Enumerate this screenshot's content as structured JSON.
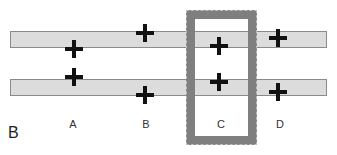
{
  "panel_label": "B",
  "columns": [
    {
      "label": "A",
      "x": 73
    },
    {
      "label": "B",
      "x": 146
    },
    {
      "label": "C",
      "x": 221
    },
    {
      "label": "D",
      "x": 280
    }
  ],
  "bars": [
    {
      "name": "top-bar",
      "top": 31
    },
    {
      "name": "bottom-bar",
      "top": 79
    }
  ],
  "markers": [
    {
      "column": "A",
      "bar": "top",
      "x": 74,
      "y": 49
    },
    {
      "column": "A",
      "bar": "bottom",
      "x": 74,
      "y": 77
    },
    {
      "column": "B",
      "bar": "top",
      "x": 145,
      "y": 33
    },
    {
      "column": "B",
      "bar": "bottom",
      "x": 145,
      "y": 95
    },
    {
      "column": "C",
      "bar": "top",
      "x": 219,
      "y": 46
    },
    {
      "column": "C",
      "bar": "bottom",
      "x": 219,
      "y": 82
    },
    {
      "column": "D",
      "bar": "top",
      "x": 278,
      "y": 38
    },
    {
      "column": "D",
      "bar": "bottom",
      "x": 278,
      "y": 92
    }
  ],
  "highlight_frame": {
    "column": "C",
    "color": "#7f7f7f"
  }
}
